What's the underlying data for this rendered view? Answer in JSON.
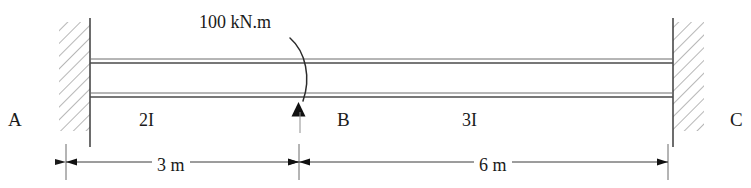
{
  "diagram": {
    "type": "structural-beam",
    "nodes": [
      {
        "id": "A",
        "label": "A",
        "support": "fixed",
        "position_m": 0
      },
      {
        "id": "B",
        "label": "B",
        "support": "none",
        "position_m": 3
      },
      {
        "id": "C",
        "label": "C",
        "support": "fixed",
        "position_m": 9
      }
    ],
    "sections": [
      {
        "label": "2I",
        "from": "A",
        "to": "B",
        "length_label": "3 m",
        "length_m": 3
      },
      {
        "label": "3I",
        "from": "B",
        "to": "C",
        "length_label": "6 m",
        "length_m": 6
      }
    ],
    "loads": [
      {
        "label": "100 kN.m",
        "magnitude": 100,
        "unit": "kN.m",
        "kind": "moment",
        "applied_at": "B",
        "arrow": "curved-clockwise"
      }
    ],
    "dimensions": [
      {
        "label": "3 m",
        "from": "A",
        "to": "B"
      },
      {
        "label": "6 m",
        "from": "B",
        "to": "C"
      }
    ],
    "colors": {
      "line": "#404040",
      "beam": "#555555",
      "hatch": "#6a6a6a",
      "text": "#1a1a1a",
      "background": "#ffffff"
    }
  }
}
